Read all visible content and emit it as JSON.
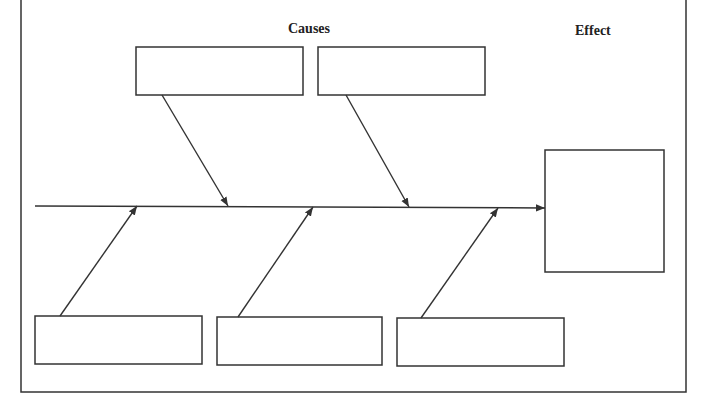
{
  "diagram": {
    "type": "fishbone",
    "labels": {
      "causes": "Causes",
      "effect": "Effect"
    },
    "colors": {
      "stroke": "#333333",
      "background": "#ffffff"
    },
    "cause_boxes": [
      {
        "id": "top-1",
        "text": ""
      },
      {
        "id": "top-2",
        "text": ""
      },
      {
        "id": "bottom-1",
        "text": ""
      },
      {
        "id": "bottom-2",
        "text": ""
      },
      {
        "id": "bottom-3",
        "text": ""
      }
    ],
    "effect_box": {
      "text": ""
    }
  }
}
